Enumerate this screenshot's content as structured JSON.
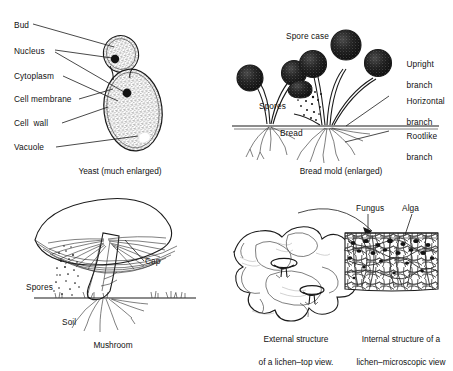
{
  "figure": {
    "background_color": "#ffffff",
    "ink_color": "#1b1b1b"
  },
  "panels": [
    {
      "id": "yeast",
      "caption": "Yeast (much enlarged)",
      "labels": [
        {
          "name": "bud",
          "text": "Bud"
        },
        {
          "name": "nucleus",
          "text": "Nucleus"
        },
        {
          "name": "cytoplasm",
          "text": "Cytoplasm"
        },
        {
          "name": "cell-membrane",
          "text": "Cell membrane"
        },
        {
          "name": "cell-wall",
          "text": "Cell  wall"
        },
        {
          "name": "vacuole",
          "text": "Vacuole"
        }
      ]
    },
    {
      "id": "bread-mold",
      "caption": "Bread mold (enlarged)",
      "labels": [
        {
          "name": "spore-case",
          "text": "Spore case"
        },
        {
          "name": "spores",
          "text": "Spores"
        },
        {
          "name": "bread",
          "text": "Bread"
        },
        {
          "name": "upright-branch-line1",
          "text": "Upright"
        },
        {
          "name": "upright-branch-line2",
          "text": "branch"
        },
        {
          "name": "horizontal-branch-line1",
          "text": "Horizontal"
        },
        {
          "name": "horizontal-branch-line2",
          "text": "branch"
        },
        {
          "name": "rootlike-branch-line1",
          "text": "Rootlike"
        },
        {
          "name": "rootlike-branch-line2",
          "text": "branch"
        }
      ]
    },
    {
      "id": "mushroom",
      "caption": "Mushroom",
      "labels": [
        {
          "name": "cap",
          "text": "Cap"
        },
        {
          "name": "spores",
          "text": "Spores"
        },
        {
          "name": "soil",
          "text": "Soil"
        }
      ]
    },
    {
      "id": "lichen",
      "caption_external_line1": "External structure",
      "caption_external_line2": "of a lichen–top view.",
      "caption_internal_line1": "Internal structure of a",
      "caption_internal_line2": "lichen–microscopic view",
      "labels": [
        {
          "name": "fungus",
          "text": "Fungus"
        },
        {
          "name": "alga",
          "text": "Alga"
        }
      ]
    }
  ]
}
